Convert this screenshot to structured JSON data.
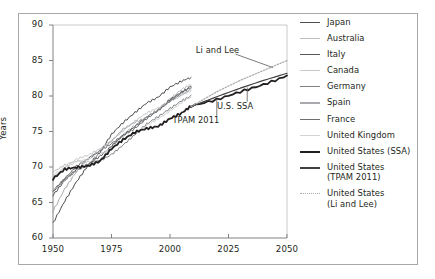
{
  "chart_data": {
    "type": "line",
    "title": "",
    "subtitle": "",
    "xlabel": "",
    "ylabel": "Years",
    "xlim": [
      1950,
      2050
    ],
    "ylim": [
      60,
      90
    ],
    "xticks": [
      1950,
      1975,
      2000,
      2025,
      2050
    ],
    "yticks": [
      60,
      65,
      70,
      75,
      80,
      85,
      90
    ],
    "grid": false,
    "legend_position": "right",
    "annotations": [
      {
        "text": "Li and Lee",
        "x": 2023,
        "y": 86.5
      },
      {
        "text": "U.S. SSA",
        "x": 2032,
        "y": 78.6
      },
      {
        "text": "TPAM 2011",
        "x": 2013,
        "y": 76.6
      }
    ],
    "series": [
      {
        "name": "Japan",
        "color": "#4d4d4f",
        "width": 1.0,
        "style": "solid",
        "x": [
          1950,
          1955,
          1960,
          1965,
          1970,
          1975,
          1980,
          1985,
          1990,
          1995,
          2000,
          2005,
          2009
        ],
        "values": [
          62.0,
          65.2,
          68.0,
          70.3,
          72.0,
          74.5,
          76.2,
          77.7,
          79.1,
          79.9,
          81.2,
          82.0,
          82.6
        ]
      },
      {
        "name": "Australia",
        "color": "#bcbec0",
        "width": 1.0,
        "style": "solid",
        "x": [
          1950,
          1955,
          1960,
          1965,
          1970,
          1975,
          1980,
          1985,
          1990,
          1995,
          2000,
          2005,
          2009
        ],
        "values": [
          69.2,
          70.2,
          70.9,
          70.8,
          71.0,
          72.8,
          74.5,
          75.8,
          77.0,
          78.1,
          79.6,
          80.9,
          81.5
        ]
      },
      {
        "name": "Italy",
        "color": "#58595b",
        "width": 1.0,
        "style": "solid",
        "x": [
          1950,
          1955,
          1960,
          1965,
          1970,
          1975,
          1980,
          1985,
          1990,
          1995,
          2000,
          2005,
          2009
        ],
        "values": [
          66.0,
          68.0,
          69.6,
          70.4,
          71.6,
          73.0,
          74.4,
          75.6,
          77.0,
          78.1,
          79.6,
          80.6,
          81.3
        ]
      },
      {
        "name": "Canada",
        "color": "#c7c8ca",
        "width": 1.0,
        "style": "solid",
        "x": [
          1950,
          1955,
          1960,
          1965,
          1970,
          1975,
          1980,
          1985,
          1990,
          1995,
          2000,
          2005,
          2009
        ],
        "values": [
          68.6,
          69.9,
          71.0,
          71.6,
          72.6,
          73.8,
          75.2,
          76.4,
          77.5,
          78.3,
          79.3,
          80.2,
          80.8
        ]
      },
      {
        "name": "Germany",
        "color": "#808285",
        "width": 1.0,
        "style": "solid",
        "x": [
          1950,
          1955,
          1960,
          1965,
          1970,
          1975,
          1980,
          1985,
          1990,
          1995,
          2000,
          2005,
          2009
        ],
        "values": [
          66.8,
          68.4,
          69.4,
          70.2,
          70.8,
          71.8,
          73.2,
          74.6,
          76.0,
          77.0,
          78.2,
          79.4,
          80.1
        ]
      },
      {
        "name": "Spain",
        "color": "#a7a9ac",
        "width": 1.0,
        "style": "solid",
        "x": [
          1950,
          1955,
          1960,
          1965,
          1970,
          1975,
          1980,
          1985,
          1990,
          1995,
          2000,
          2005,
          2009
        ],
        "values": [
          63.8,
          67.0,
          69.4,
          71.2,
          72.2,
          73.6,
          75.4,
          76.4,
          77.0,
          78.0,
          79.2,
          80.2,
          81.0
        ]
      },
      {
        "name": "France",
        "color": "#6d6e71",
        "width": 1.0,
        "style": "solid",
        "x": [
          1950,
          1955,
          1960,
          1965,
          1970,
          1975,
          1980,
          1985,
          1990,
          1995,
          2000,
          2005,
          2009
        ],
        "values": [
          66.4,
          68.4,
          70.2,
          71.2,
          72.2,
          73.2,
          74.4,
          75.5,
          76.9,
          78.0,
          79.2,
          80.4,
          81.2
        ]
      },
      {
        "name": "United Kingdom",
        "color": "#d1d3d4",
        "width": 1.0,
        "style": "solid",
        "x": [
          1950,
          1955,
          1960,
          1965,
          1970,
          1975,
          1980,
          1985,
          1990,
          1995,
          2000,
          2005,
          2009
        ],
        "values": [
          68.8,
          69.8,
          70.8,
          71.2,
          71.8,
          72.6,
          73.8,
          74.8,
          75.9,
          76.9,
          77.9,
          79.0,
          79.8
        ]
      },
      {
        "name": "United States (SSA)",
        "color": "#231f20",
        "width": 1.8,
        "style": "solid",
        "x": [
          1950,
          1955,
          1960,
          1965,
          1970,
          1975,
          1980,
          1985,
          1990,
          1995,
          2000,
          2005,
          2009,
          2020,
          2030,
          2040,
          2050
        ],
        "values": [
          68.3,
          69.6,
          69.9,
          70.2,
          70.9,
          72.6,
          73.8,
          74.8,
          75.4,
          75.8,
          76.9,
          77.6,
          78.5,
          79.4,
          80.6,
          81.7,
          82.9
        ]
      },
      {
        "name": "United States (TPAM 2011)",
        "color": "#414042",
        "width": 1.2,
        "style": "solid",
        "x": [
          2009,
          2020,
          2030,
          2040,
          2050
        ],
        "values": [
          78.5,
          79.9,
          81.1,
          82.2,
          83.2
        ]
      },
      {
        "name": "United States (Li and Lee)",
        "color": "#a7a9ac",
        "width": 1.2,
        "style": "dotted",
        "x": [
          2009,
          2020,
          2030,
          2040,
          2050
        ],
        "values": [
          78.5,
          80.6,
          82.2,
          83.6,
          85.0
        ]
      }
    ]
  },
  "legend": {
    "items": [
      {
        "label": "Japan",
        "label2": "",
        "color": "#4d4d4f",
        "width": 1.1,
        "style": "solid"
      },
      {
        "label": "Australia",
        "label2": "",
        "color": "#bcbec0",
        "width": 1.1,
        "style": "solid"
      },
      {
        "label": "Italy",
        "label2": "",
        "color": "#58595b",
        "width": 1.1,
        "style": "solid"
      },
      {
        "label": "Canada",
        "label2": "",
        "color": "#c7c8ca",
        "width": 1.1,
        "style": "solid"
      },
      {
        "label": "Germany",
        "label2": "",
        "color": "#808285",
        "width": 1.1,
        "style": "solid"
      },
      {
        "label": "Spain",
        "label2": "",
        "color": "#a7a9ac",
        "width": 1.1,
        "style": "solid"
      },
      {
        "label": "France",
        "label2": "",
        "color": "#6d6e71",
        "width": 1.1,
        "style": "solid"
      },
      {
        "label": "United Kingdom",
        "label2": "",
        "color": "#d1d3d4",
        "width": 1.1,
        "style": "solid"
      },
      {
        "label": "United States (SSA)",
        "label2": "",
        "color": "#231f20",
        "width": 2.2,
        "style": "solid"
      },
      {
        "label": "United States",
        "label2": "(TPAM 2011)",
        "color": "#414042",
        "width": 2.0,
        "style": "solid"
      },
      {
        "label": "United States",
        "label2": "(Li and Lee)",
        "color": "#a7a9ac",
        "width": 1.4,
        "style": "dotted"
      }
    ]
  },
  "axes": {
    "ylabel": "Years",
    "yticks": [
      "90",
      "85",
      "80",
      "75",
      "70",
      "65",
      "60"
    ],
    "xticks": [
      "1950",
      "1975",
      "2000",
      "2025",
      "2050"
    ]
  }
}
